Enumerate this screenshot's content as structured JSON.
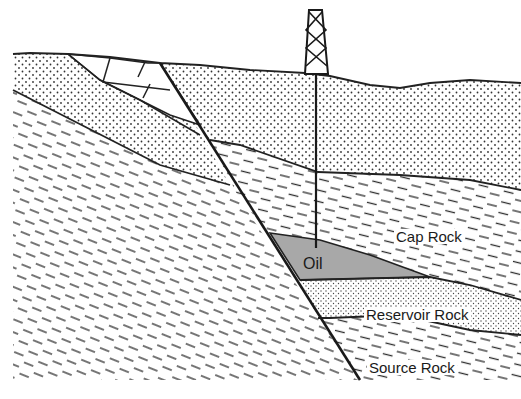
{
  "diagram": {
    "type": "geological-cross-section",
    "labels": {
      "oil": "Oil",
      "cap_rock": "Cap Rock",
      "reservoir_rock": "Reservoir Rock",
      "source_rock": "Source Rock"
    },
    "elements": [
      {
        "name": "drilling-derrick",
        "description": "Lattice oil derrick on surface"
      },
      {
        "name": "well-bore",
        "description": "Vertical well from derrick down into oil pocket"
      },
      {
        "name": "fault-line",
        "description": "Diagonal fault cutting through strata"
      },
      {
        "name": "oil-pocket",
        "description": "Grey triangular oil accumulation trapped against fault"
      },
      {
        "name": "surface-sandstone",
        "description": "Dotted upper strata"
      },
      {
        "name": "cap-rock-layer",
        "description": "Dashed shale layer above reservoir"
      },
      {
        "name": "reservoir-rock-layer",
        "description": "Dotted porous layer"
      },
      {
        "name": "source-rock-layer",
        "description": "Dashed layer at base"
      },
      {
        "name": "fault-blocks",
        "description": "Broken blocks near surface along fault"
      }
    ],
    "colors": {
      "line": "#222222",
      "oil_fill": "#a8a8a8",
      "dot": "#333333",
      "dash": "#2a2a2a",
      "background": "#ffffff"
    }
  }
}
